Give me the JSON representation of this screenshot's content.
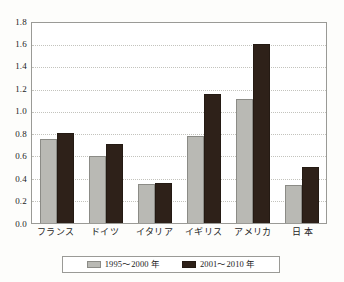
{
  "chart_data": {
    "type": "bar",
    "title": "",
    "subtitle": "",
    "xlabel": "",
    "ylabel": "",
    "ylim": [
      0.0,
      1.8
    ],
    "ytick_labels": [
      "1.8",
      "1.6",
      "1.4",
      "1.2",
      "1.0",
      "0.8",
      "0.6",
      "0.4",
      "0.2",
      "0.0"
    ],
    "ytick_values": [
      1.8,
      1.6,
      1.4,
      1.2,
      1.0,
      0.8,
      0.6,
      0.4,
      0.2,
      0.0
    ],
    "grid": true,
    "grid_style": "dotted-horizontal",
    "legend_position": "bottom",
    "categories": [
      "フランス",
      "ドイツ",
      "イタリア",
      "イギリス",
      "アメリカ",
      "日 本"
    ],
    "series": [
      {
        "name": "1995～2000 年",
        "color": "#b9b9b4",
        "values": [
          0.76,
          0.6,
          0.35,
          0.78,
          1.12,
          0.34
        ]
      },
      {
        "name": "2001～2010 年",
        "color": "#2e2119",
        "values": [
          0.81,
          0.71,
          0.36,
          1.16,
          1.61,
          0.5
        ]
      }
    ]
  }
}
